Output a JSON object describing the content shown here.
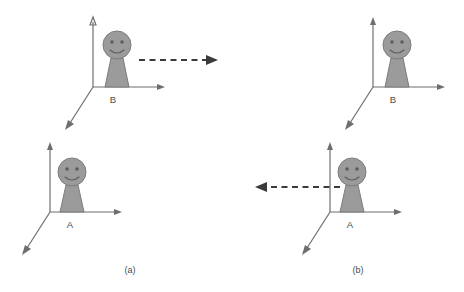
{
  "figure": {
    "title": "",
    "background_color": "#ffffff",
    "panels": [
      {
        "id": "panel-a",
        "caption": "(a)",
        "caption_x": 130,
        "caption_y": 271,
        "frames": [
          {
            "id": "frame-b-a",
            "label": "B",
            "label_x": 113,
            "label_y": 100,
            "origin_x": 93,
            "origin_y": 87,
            "y_axis_tip_x": 93,
            "y_axis_tip_y": 18,
            "x_axis_tip_x": 164,
            "x_axis_tip_y": 87,
            "z_axis_tip_x": 66,
            "z_axis_tip_y": 127,
            "person": {
              "head_cx": 117,
              "head_cy": 45,
              "head_r": 14,
              "neck_top_y": 58,
              "body_top_half_w": 6,
              "body_bottom_half_w": 12,
              "body_bottom_y": 87
            }
          },
          {
            "id": "frame-a-a",
            "label": "A",
            "label_x": 70,
            "label_y": 225,
            "origin_x": 50,
            "origin_y": 212,
            "y_axis_tip_x": 50,
            "y_axis_tip_y": 143,
            "x_axis_tip_x": 121,
            "x_axis_tip_y": 212,
            "z_axis_tip_x": 23,
            "z_axis_tip_y": 252,
            "person": {
              "head_cx": 72,
              "head_cy": 172,
              "head_r": 14,
              "neck_top_y": 185,
              "body_top_half_w": 6,
              "body_bottom_half_w": 12,
              "body_bottom_y": 212
            }
          }
        ],
        "arrow": {
          "id": "motion-arrow-a",
          "direction": "right",
          "from_x": 139,
          "from_y": 60,
          "to_x": 216,
          "to_y": 60,
          "color": "#3b3b3b"
        }
      },
      {
        "id": "panel-b",
        "caption": "(b)",
        "caption_x": 358,
        "caption_y": 271,
        "frames": [
          {
            "id": "frame-b-b",
            "label": "B",
            "label_x": 393,
            "label_y": 100,
            "origin_x": 373,
            "origin_y": 87,
            "y_axis_tip_x": 373,
            "y_axis_tip_y": 18,
            "x_axis_tip_x": 444,
            "x_axis_tip_y": 87,
            "z_axis_tip_x": 346,
            "z_axis_tip_y": 127,
            "person": {
              "head_cx": 397,
              "head_cy": 45,
              "head_r": 14,
              "neck_top_y": 58,
              "body_top_half_w": 6,
              "body_bottom_half_w": 12,
              "body_bottom_y": 87
            }
          },
          {
            "id": "frame-a-b",
            "label": "A",
            "label_x": 350,
            "label_y": 225,
            "origin_x": 330,
            "origin_y": 212,
            "y_axis_tip_x": 330,
            "y_axis_tip_y": 143,
            "x_axis_tip_x": 401,
            "x_axis_tip_y": 212,
            "z_axis_tip_x": 303,
            "z_axis_tip_y": 252,
            "person": {
              "head_cx": 352,
              "head_cy": 172,
              "head_r": 14,
              "neck_top_y": 185,
              "body_top_half_w": 6,
              "body_bottom_half_w": 12,
              "body_bottom_y": 212
            }
          }
        ],
        "arrow": {
          "id": "motion-arrow-b",
          "direction": "left",
          "from_x": 340,
          "from_y": 187,
          "to_x": 256,
          "to_y": 187,
          "color": "#3b3b3b"
        }
      }
    ],
    "colors": {
      "axis": "#6e6e6e",
      "person_fill": "#9b9b9b",
      "person_stroke": "#7c7c7c",
      "face": "#5d5d5d",
      "arrow": "#3b3b3b",
      "text": "#4a4a4a"
    }
  }
}
